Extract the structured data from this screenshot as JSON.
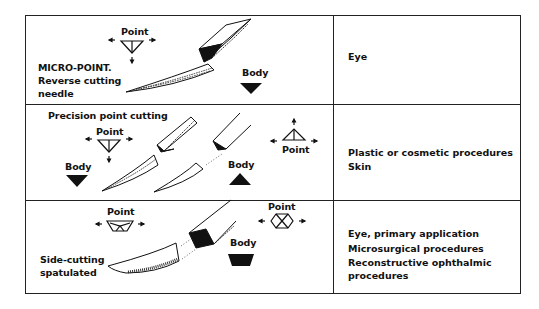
{
  "table": {
    "rows": [
      {
        "needle_type": "MICRO-POINT. Reverse cutting needle",
        "needle_type_lines": [
          "MICRO-POINT.",
          "Reverse cutting",
          "needle"
        ],
        "point_label": "Point",
        "body_label": "Body",
        "point_shape": "inverted-triangle-with-center-line",
        "body_shape": "solid-inverted-triangle",
        "uses": [
          "Eye"
        ]
      },
      {
        "needle_type": "Precision point cutting",
        "needle_type_lines": [
          "Precision point cutting"
        ],
        "point_label": "Point",
        "body_label": "Body",
        "point_label_2": "Point",
        "body_label_2": "Body",
        "point_shape": "inverted-triangle-with-center-line",
        "point_shape_2": "triangle-with-center-line",
        "body_shape": "solid-inverted-triangle",
        "body_shape_2": "solid-triangle",
        "uses": [
          "Plastic or cosmetic procedures",
          "Skin"
        ]
      },
      {
        "needle_type": "Side-cutting spatulated",
        "needle_type_lines": [
          "Side-cutting",
          "spatulated"
        ],
        "point_label": "Point",
        "point_label_2": "Point",
        "body_label": "Body",
        "point_shape": "trapezoid-with-inner-lines",
        "point_shape_2": "hexagon-with-x",
        "body_shape": "solid-trapezoid",
        "uses": [
          "Eye, primary application",
          "Microsurgical procedures",
          "Reconstructive ophthalmic",
          "procedures"
        ]
      }
    ]
  }
}
